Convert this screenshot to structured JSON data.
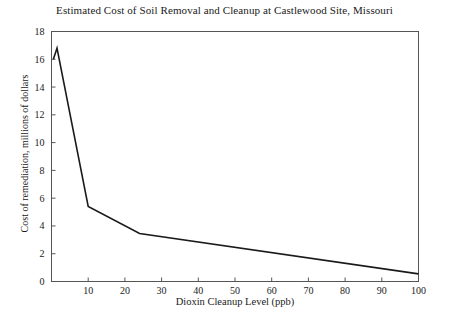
{
  "chart_data": {
    "type": "line",
    "title": "Estimated Cost of Soil Removal and Cleanup at Castlewood Site, Missouri",
    "xlabel": "Dioxin Cleanup Level (ppb)",
    "ylabel": "Cost of remediation, millions of dollars",
    "xlim": [
      0,
      100
    ],
    "ylim": [
      0,
      18
    ],
    "xticks": [
      0,
      10,
      20,
      30,
      40,
      50,
      60,
      70,
      80,
      90,
      100
    ],
    "xtick_labels": [
      "",
      "10",
      "20",
      "30",
      "40",
      "50",
      "60",
      "70",
      "80",
      "90",
      "100"
    ],
    "yticks": [
      0,
      2,
      4,
      6,
      8,
      10,
      12,
      14,
      16,
      18
    ],
    "ytick_labels": [
      "0",
      "2",
      "4",
      "6",
      "8",
      "10",
      "12",
      "14",
      "16",
      "18"
    ],
    "grid": false,
    "legend": false,
    "line_color": "#1a1a1a",
    "frame_color": "#555555",
    "series": [
      {
        "name": "Cost of remediation",
        "x": [
          0.5,
          1.5,
          10,
          24,
          100
        ],
        "values": [
          16.0,
          16.8,
          5.4,
          3.45,
          0.55
        ]
      }
    ]
  }
}
